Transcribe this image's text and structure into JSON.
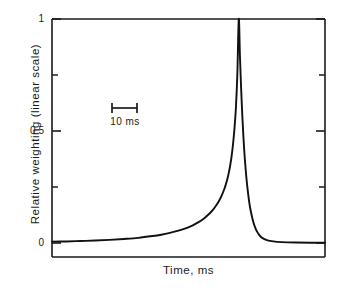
{
  "chart_data": {
    "type": "line",
    "title": "",
    "xlabel": "Time, ms",
    "ylabel": "Relative weighting (linear scale)",
    "ylim": [
      0,
      1
    ],
    "yticks": [
      0,
      0.5,
      1
    ],
    "ytick_labels": [
      "0",
      "0.5",
      "1"
    ],
    "yminor_ticks": [
      0.25,
      0.75
    ],
    "xticks": [],
    "xtick_labels": [],
    "grid": false,
    "legend": false,
    "annotations": [
      {
        "name": "scale-bar",
        "label": "10 ms",
        "kind": "horizontal-scale-bar",
        "length_ms": 10
      }
    ],
    "series": [
      {
        "name": "Relative weighting",
        "color": "#111111",
        "description": "Asymmetric temporal weighting function: slow exponential rise to a sharp unity peak, followed by a rapid exponential decay back to zero.",
        "peak_value": 1,
        "peak_x_ms": 0,
        "rise_time_constant_ms": 13,
        "decay_time_constant_ms": 2.2,
        "x": [
          -65,
          -60,
          -55,
          -50,
          -45,
          -40,
          -35,
          -30,
          -27,
          -24,
          -21,
          -18,
          -16,
          -14,
          -12,
          -10,
          -9,
          -8,
          -7,
          -6,
          -5,
          -4.5,
          -4,
          -3.5,
          -3,
          -2.5,
          -2,
          -1.5,
          -1,
          -0.5,
          0,
          0.4,
          0.8,
          1.2,
          1.6,
          2,
          2.5,
          3,
          3.5,
          4,
          5,
          6,
          7,
          8,
          10,
          12,
          15,
          20,
          25,
          30
        ],
        "y": [
          0.006,
          0.007,
          0.009,
          0.011,
          0.014,
          0.018,
          0.023,
          0.031,
          0.037,
          0.045,
          0.055,
          0.068,
          0.079,
          0.093,
          0.111,
          0.134,
          0.148,
          0.165,
          0.185,
          0.21,
          0.242,
          0.262,
          0.285,
          0.312,
          0.346,
          0.388,
          0.442,
          0.512,
          0.604,
          0.755,
          1.0,
          0.835,
          0.693,
          0.575,
          0.476,
          0.394,
          0.312,
          0.247,
          0.195,
          0.154,
          0.096,
          0.06,
          0.038,
          0.024,
          0.012,
          0.007,
          0.004,
          0.002,
          0.001,
          0.001
        ]
      }
    ],
    "colors": {
      "curve": "#111111",
      "axis": "#1a1a1a",
      "background": "#ffffff"
    },
    "axes_box": {
      "left_px": 52,
      "right_px": 325,
      "top_px": 19,
      "bottom_px": 257
    }
  }
}
